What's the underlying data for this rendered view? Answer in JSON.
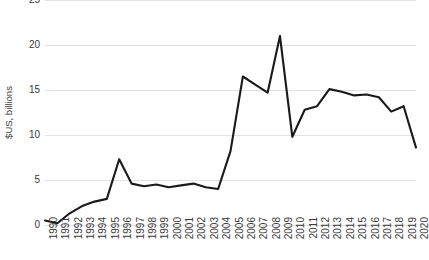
{
  "chart_data": {
    "type": "line",
    "title": "",
    "xlabel": "",
    "ylabel": "$US, billions",
    "ylim": [
      0,
      25
    ],
    "yticks": [
      0,
      5,
      10,
      15,
      20,
      25
    ],
    "grid": true,
    "legend": false,
    "line_color": "#1a1a1a",
    "grid_color": "#e2e2e2",
    "categories": [
      "1990",
      "1991",
      "1992",
      "1993",
      "1994",
      "1995",
      "1996",
      "1997",
      "1998",
      "1999",
      "2000",
      "2001",
      "2002",
      "2003",
      "2004",
      "2005",
      "2006",
      "2007",
      "2008",
      "2009",
      "2010",
      "2011",
      "2012",
      "2013",
      "2014",
      "2015",
      "2016",
      "2017",
      "2018",
      "2019",
      "2020"
    ],
    "values": [
      0.5,
      0.2,
      1.3,
      2.1,
      2.6,
      2.9,
      7.3,
      4.6,
      4.3,
      4.5,
      4.2,
      4.4,
      4.6,
      4.2,
      4.0,
      8.2,
      16.5,
      15.6,
      14.7,
      21.0,
      9.8,
      12.8,
      13.2,
      15.1,
      14.8,
      14.4,
      14.5,
      14.2,
      12.6,
      13.2,
      8.6
    ]
  }
}
